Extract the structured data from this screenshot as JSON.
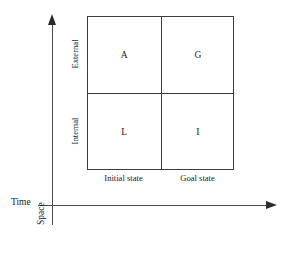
{
  "diagram": {
    "type": "2x2-matrix-with-axes",
    "background_color": "#ffffff",
    "line_color": "#3c3c3c",
    "text_color": "#1a1a1a",
    "axes": {
      "horizontal": {
        "label": "Time",
        "arrow_direction": "right"
      },
      "vertical": {
        "label": "Space",
        "arrow_direction": "up"
      }
    },
    "matrix": {
      "row_labels": [
        "External",
        "Internal"
      ],
      "column_labels": [
        "Initial state",
        "Goal state"
      ],
      "cells": [
        {
          "row": "External",
          "column": "Initial state",
          "label": "A"
        },
        {
          "row": "External",
          "column": "Goal state",
          "label": "G"
        },
        {
          "row": "Internal",
          "column": "Initial state",
          "label": "L"
        },
        {
          "row": "Internal",
          "column": "Goal state",
          "label": "I"
        }
      ]
    }
  }
}
